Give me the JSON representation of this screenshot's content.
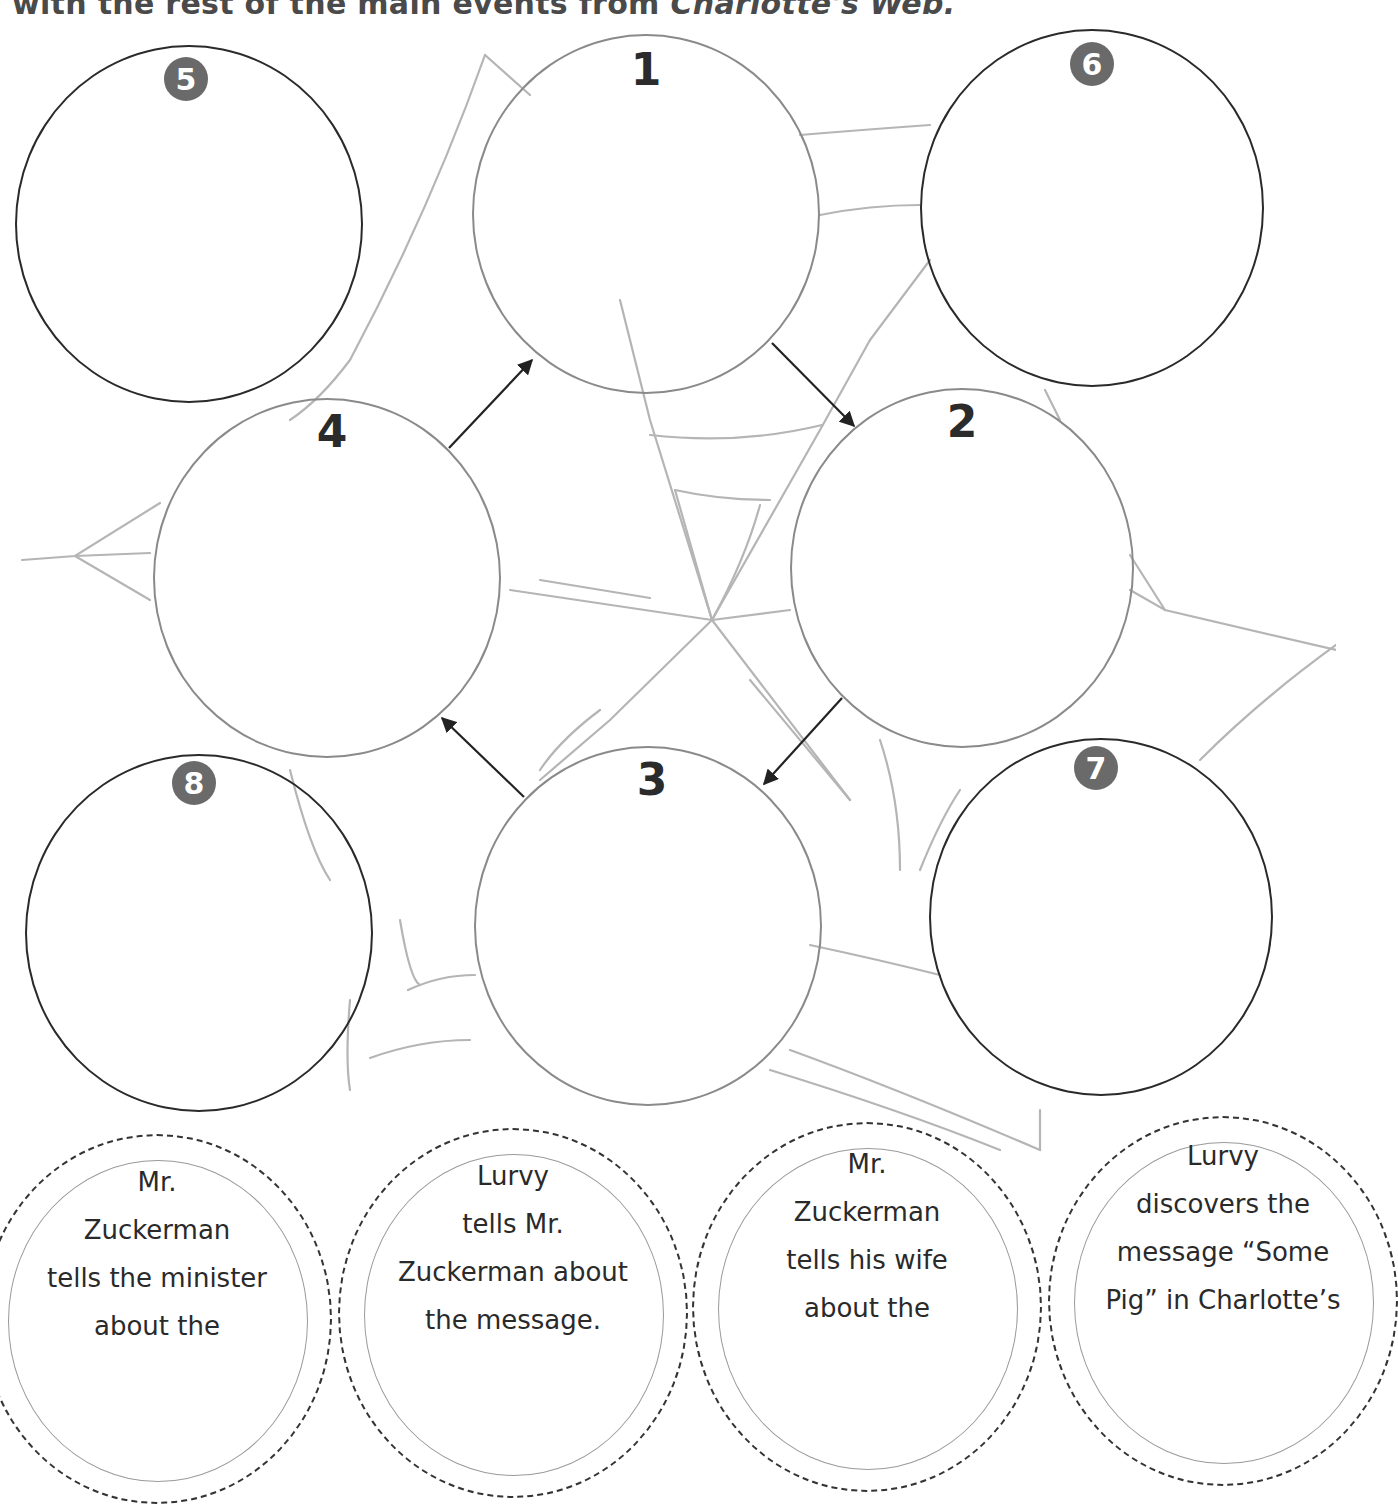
{
  "instruction": {
    "text_prefix": "with the rest of the main events from ",
    "book_title": "Charlotte's Web."
  },
  "sequence_circles": [
    {
      "id": "1",
      "label": "1"
    },
    {
      "id": "2",
      "label": "2"
    },
    {
      "id": "3",
      "label": "3"
    },
    {
      "id": "4",
      "label": "4"
    }
  ],
  "extra_circles": [
    {
      "id": "5",
      "label": "5"
    },
    {
      "id": "6",
      "label": "6"
    },
    {
      "id": "7",
      "label": "7"
    },
    {
      "id": "8",
      "label": "8"
    }
  ],
  "arrows": [
    {
      "from": "1",
      "to": "2"
    },
    {
      "from": "2",
      "to": "3"
    },
    {
      "from": "3",
      "to": "4"
    },
    {
      "from": "4",
      "to": "1"
    }
  ],
  "event_cards": [
    {
      "lines": [
        "Mr.",
        "Zuckerman",
        "tells the minister",
        "about the"
      ]
    },
    {
      "lines": [
        "Lurvy",
        "tells Mr.",
        "Zuckerman about",
        "the message."
      ]
    },
    {
      "lines": [
        "Mr.",
        "Zuckerman",
        "tells his wife",
        "about the"
      ]
    },
    {
      "lines": [
        "Lurvy",
        "discovers the",
        "message “Some",
        "Pig” in Charlotte’s"
      ]
    }
  ],
  "colors": {
    "main_circle_stroke": "#8a8a8a",
    "extra_circle_stroke": "#2a2a2a",
    "badge_fill": "#6a6a6a",
    "web_stroke": "#b5b5b5"
  }
}
